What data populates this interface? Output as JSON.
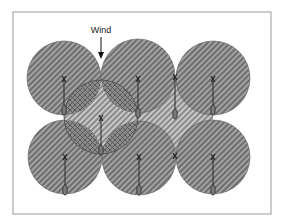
{
  "figure": {
    "type": "sprinkler-coverage-diagram",
    "frame": {
      "x": 13,
      "y": 12,
      "width": 258,
      "height": 202,
      "stroke": "#9a9a9a"
    },
    "wind": {
      "label": "Wind",
      "direction": "down",
      "label_x": 101,
      "label_y": 33,
      "arrow_x": 101,
      "arrow_y1": 37,
      "arrow_y2": 58
    },
    "colors": {
      "coverage_stripe_dark": "#6e6e6e",
      "coverage_stripe_light": "#a2a2a2",
      "gap_stripe_dark": "#8a8a8a",
      "gap_stripe_light": "#c8c8c8",
      "crosshatch_line": "#555555",
      "sprinkler_line": "#2a2a2a",
      "frame": "#9a9a9a"
    },
    "coverage_circles": [
      {
        "id": "top-left",
        "cx": 64,
        "cy": 78,
        "r": 37
      },
      {
        "id": "top-center",
        "cx": 138,
        "cy": 76,
        "r": 37
      },
      {
        "id": "top-right",
        "cx": 213,
        "cy": 78,
        "r": 37
      },
      {
        "id": "bottom-left",
        "cx": 65,
        "cy": 157,
        "r": 37
      },
      {
        "id": "bottom-center",
        "cx": 139,
        "cy": 158,
        "r": 37
      },
      {
        "id": "bottom-right",
        "cx": 213,
        "cy": 157,
        "r": 37
      }
    ],
    "shifted_circle": {
      "id": "wind-shifted",
      "cx": 101,
      "cy": 117,
      "r": 37,
      "pattern": "crosshatch"
    },
    "sprinklers": [
      {
        "id": "s1",
        "x": 64,
        "y_head": 79,
        "y_tail": 113
      },
      {
        "id": "s2",
        "x": 138,
        "y_head": 79,
        "y_tail": 116
      },
      {
        "id": "s3",
        "x": 213,
        "y_head": 79,
        "y_tail": 113
      },
      {
        "id": "s4",
        "x": 101,
        "y_head": 118,
        "y_tail": 153
      },
      {
        "id": "s5",
        "x": 175,
        "y_head": 77,
        "y_tail": 117
      },
      {
        "id": "s6",
        "x": 65,
        "y_head": 157,
        "y_tail": 193
      },
      {
        "id": "s7",
        "x": 139,
        "y_head": 157,
        "y_tail": 193
      },
      {
        "id": "s8",
        "x": 213,
        "y_head": 157,
        "y_tail": 193
      }
    ],
    "extra_marks": [
      {
        "id": "m1",
        "x": 175,
        "y": 156
      }
    ]
  }
}
